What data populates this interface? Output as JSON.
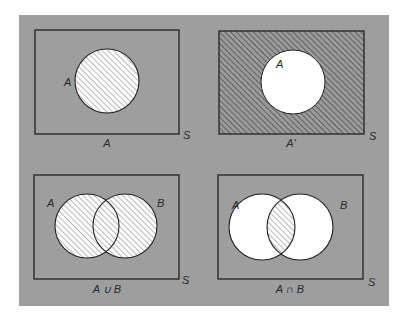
{
  "figure": {
    "background_color": "#9e9e9e",
    "line_color": "#222222",
    "hatch_color": "#555555",
    "fill_white": "#ffffff",
    "panels": [
      {
        "id": "set-a",
        "description": "Set A shaded",
        "universe_label": "S",
        "set_labels": [
          "A"
        ],
        "caption": "A"
      },
      {
        "id": "complement-a",
        "description": "Complement of A shaded",
        "universe_label": "S",
        "set_labels": [
          "A"
        ],
        "caption": "A′"
      },
      {
        "id": "union",
        "description": "Union of A and B shaded",
        "universe_label": "S",
        "set_labels": [
          "A",
          "B"
        ],
        "caption": "A ∪ B"
      },
      {
        "id": "intersection",
        "description": "Intersection of A and B shaded",
        "universe_label": "S",
        "set_labels": [
          "A",
          "B"
        ],
        "caption": "A ∩ B"
      }
    ]
  }
}
